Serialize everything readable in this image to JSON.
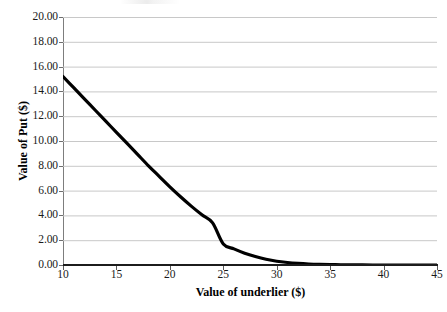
{
  "chart_data": {
    "type": "line",
    "title": "",
    "xlabel": "Value of underlier ($)",
    "ylabel": "Value of Put ($)",
    "xlim": [
      10,
      45
    ],
    "ylim": [
      0,
      20
    ],
    "grid": true,
    "legend": null,
    "legend_position": "none",
    "series": [
      {
        "name": "Value of Put",
        "color": "#000000",
        "x": [
          10,
          11,
          12,
          13,
          14,
          15,
          16,
          17,
          18,
          19,
          20,
          21,
          22,
          23,
          24,
          25,
          26,
          27,
          28,
          29,
          30,
          31,
          32,
          33,
          34,
          35,
          36,
          37,
          38,
          39,
          40,
          41,
          42,
          43,
          44,
          45
        ],
        "values": [
          15.2,
          14.3,
          13.4,
          12.5,
          11.6,
          10.7,
          9.8,
          8.9,
          8.0,
          7.15,
          6.3,
          5.5,
          4.75,
          4.05,
          3.4,
          1.7,
          1.3,
          0.95,
          0.68,
          0.46,
          0.3,
          0.2,
          0.13,
          0.08,
          0.05,
          0.03,
          0.02,
          0.01,
          0.01,
          0.0,
          0.0,
          0.0,
          0.0,
          0.0,
          0.0,
          0.0
        ]
      }
    ],
    "x_ticks": [
      10,
      15,
      20,
      25,
      30,
      35,
      40,
      45
    ],
    "x_tick_labels": [
      "10",
      "15",
      "20",
      "25",
      "30",
      "35",
      "40",
      "45"
    ],
    "y_ticks": [
      0,
      2,
      4,
      6,
      8,
      10,
      12,
      14,
      16,
      18,
      20
    ],
    "y_tick_labels": [
      "0.00",
      "2.00",
      "4.00",
      "6.00",
      "8.00",
      "10.00",
      "12.00",
      "14.00",
      "16.00",
      "18.00",
      "20.00"
    ],
    "gridline_color": "#c8c8c8",
    "axis_color": "#1c1c1c",
    "background_color": "#ffffff"
  }
}
